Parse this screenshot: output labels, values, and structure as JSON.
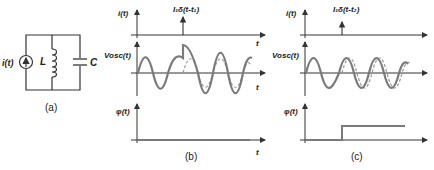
{
  "panels": {
    "a": {
      "caption": "(a)",
      "source_label": "i(t)",
      "inductor_label": "L",
      "capacitor_label": "C"
    },
    "b": {
      "caption": "(b)",
      "current_axis_label": "i(t)",
      "impulse_label": "I₁δ(t-t₁)",
      "voltage_axis_label": "Vosc(t)",
      "phase_axis_label": "φ(t)",
      "time_label": "t"
    },
    "c": {
      "caption": "(c)",
      "current_axis_label": "i(t)",
      "impulse_label": "I₁δ(t-t₂)",
      "voltage_axis_label": "Vosc(t)",
      "phase_axis_label": "φ(t)",
      "time_label": "t"
    }
  },
  "colors": {
    "axis": "#333333",
    "wave": "#7a7a7a",
    "wave_dashed": "#9a9a9a",
    "circuit": "#333333"
  }
}
